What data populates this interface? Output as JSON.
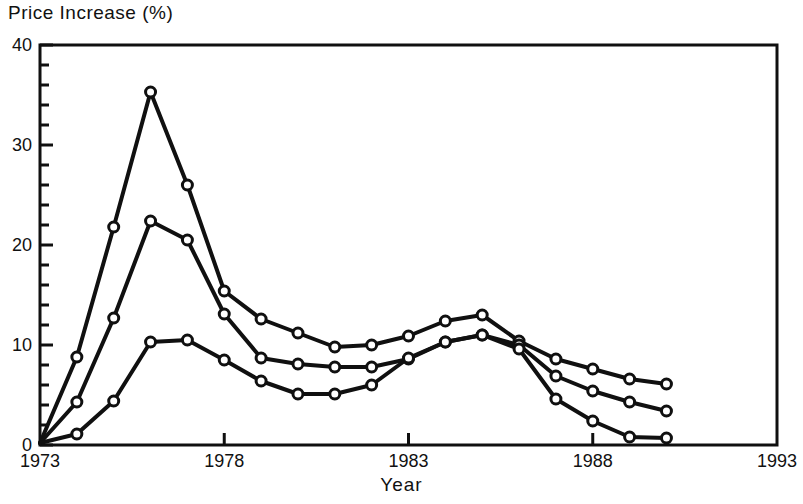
{
  "chart_data": {
    "type": "line",
    "title": "",
    "ylabel": "Price Increase (%)",
    "xlabel": "Year",
    "xlim": [
      1973,
      1993
    ],
    "ylim": [
      0,
      40
    ],
    "grid": false,
    "legend": "none",
    "x_ticks": [
      "1973",
      "1978",
      "1983",
      "1988",
      "1993"
    ],
    "x_tick_values": [
      1973,
      1978,
      1983,
      1988,
      1993
    ],
    "y_ticks": [
      "0",
      "10",
      "20",
      "30",
      "40"
    ],
    "y_tick_values": [
      0,
      10,
      20,
      30,
      40
    ],
    "y_minor_step": 2,
    "marker": "open-circle",
    "x": [
      1973,
      1974,
      1975,
      1976,
      1977,
      1978,
      1979,
      1980,
      1981,
      1982,
      1983,
      1984,
      1985,
      1986,
      1987,
      1988,
      1989,
      1990
    ],
    "series": [
      {
        "name": "series-upper",
        "values": [
          0.2,
          8.8,
          21.8,
          35.3,
          26.0,
          15.4,
          12.6,
          11.2,
          9.8,
          10.0,
          10.9,
          12.4,
          13.0,
          10.4,
          8.6,
          7.6,
          6.6,
          6.1
        ]
      },
      {
        "name": "series-middle",
        "values": [
          0.2,
          4.3,
          12.7,
          22.4,
          20.5,
          13.1,
          8.7,
          8.1,
          7.8,
          7.8,
          8.6,
          10.3,
          11.0,
          10.0,
          6.9,
          5.4,
          4.3,
          3.4
        ]
      },
      {
        "name": "series-lower",
        "values": [
          0.2,
          1.1,
          4.4,
          10.3,
          10.5,
          8.5,
          6.4,
          5.1,
          5.1,
          6.0,
          8.7,
          10.3,
          11.0,
          9.6,
          4.6,
          2.4,
          0.8,
          0.7
        ]
      }
    ],
    "style": {
      "line_color": "#101010",
      "marker_fill": "#ffffff",
      "axis_color": "#101010",
      "background": "#ffffff",
      "line_width": 4,
      "marker_radius": 5
    }
  },
  "plot_geometry": {
    "left": 40,
    "right": 777,
    "top": 45,
    "bottom": 445
  }
}
